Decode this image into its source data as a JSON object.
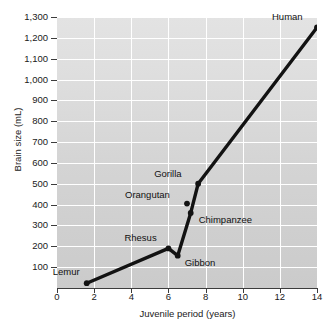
{
  "chart_data": {
    "type": "line",
    "title": "",
    "xlabel": "Juvenile period (years)",
    "ylabel": "Brain size (mL)",
    "xlim": [
      0,
      14
    ],
    "ylim": [
      0,
      1300
    ],
    "xticks": [
      0,
      2,
      4,
      6,
      8,
      10,
      12,
      14
    ],
    "xtick_labels": [
      "0",
      "2",
      "4",
      "6",
      "8",
      "10",
      "12",
      "14"
    ],
    "yticks": [
      100,
      200,
      300,
      400,
      500,
      600,
      700,
      800,
      900,
      1000,
      1100,
      1200,
      1300
    ],
    "ytick_labels": [
      "100",
      "200",
      "300",
      "400",
      "500",
      "600",
      "700",
      "800",
      "900",
      "1,000",
      "1,100",
      "1,200",
      "1,300"
    ],
    "grid": true,
    "legend": "none",
    "plot_background": "#d8d8d8",
    "gridline_color": "#ffffff",
    "series_color": "#121212",
    "points": [
      {
        "name": "Lemur",
        "x": 1.6,
        "y": 23,
        "label_dx": -34,
        "label_dy": -16
      },
      {
        "name": "Rhesus",
        "x": 6.0,
        "y": 190,
        "label_dx": -44,
        "label_dy": -15
      },
      {
        "name": "Gibbon",
        "x": 6.5,
        "y": 155,
        "label_dx": 7,
        "label_dy": 2
      },
      {
        "name": "Orangutan",
        "x": 7.0,
        "y": 405,
        "label_dx": -62,
        "label_dy": -14
      },
      {
        "name": "Chimpanzee",
        "x": 7.2,
        "y": 360,
        "label_dx": 8,
        "label_dy": 2
      },
      {
        "name": "Gorilla",
        "x": 7.6,
        "y": 500,
        "label_dx": -44,
        "label_dy": -15
      },
      {
        "name": "Human",
        "x": 14.0,
        "y": 1250,
        "label_dx": -45,
        "label_dy": -15
      }
    ],
    "line_path_order": [
      "Lemur",
      "Rhesus",
      "Gibbon",
      "Chimpanzee",
      "Gorilla",
      "Human"
    ]
  }
}
